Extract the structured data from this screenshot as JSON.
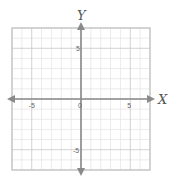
{
  "chart_data": {
    "type": "scatter",
    "title": "",
    "xlabel": "X",
    "ylabel": "Y",
    "xlim": [
      -7,
      7
    ],
    "ylim": [
      -7,
      7
    ],
    "grid": true,
    "minor_step": 1,
    "major_step": 5,
    "x_ticks": [
      {
        "value": -5,
        "label": "-5"
      },
      {
        "value": 0,
        "label": "0"
      },
      {
        "value": 5,
        "label": "5"
      }
    ],
    "y_ticks": [
      {
        "value": 5,
        "label": "5"
      },
      {
        "value": -5,
        "label": "-5"
      }
    ],
    "series": [],
    "axes_arrows": true
  },
  "colors": {
    "minor_grid": "#e6e6e6",
    "major_grid": "#c8c8c8",
    "border": "#bdbdbd",
    "axis": "#8a8a8a",
    "tick_text": "#666666"
  }
}
